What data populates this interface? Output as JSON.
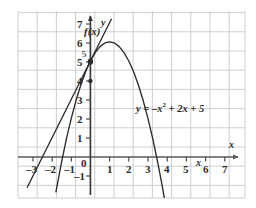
{
  "chart_data": {
    "type": "line",
    "title": "",
    "xlabel": "x",
    "ylabel": "y",
    "xlim": [
      -3.6,
      7.6
    ],
    "ylim": [
      -1.6,
      7.4
    ],
    "grid": true,
    "legend": "none",
    "series": [
      {
        "name": "parabola",
        "label": "y = –x² + 2x + 5",
        "equation": "y = -x^2 + 2x + 5",
        "color": "#2b2b2b",
        "x": [
          -1.8,
          -1.5,
          -1.25,
          -1.0,
          -0.75,
          -0.5,
          -0.25,
          0.0,
          0.25,
          0.5,
          0.75,
          1.0,
          1.25,
          1.5,
          1.75,
          2.0,
          2.25,
          2.5,
          2.75,
          3.0,
          3.25,
          3.5,
          3.75,
          4.0,
          4.1
        ],
        "y": [
          -1.84,
          -0.25,
          0.94,
          2.0,
          2.94,
          3.75,
          4.44,
          5.0,
          5.44,
          5.75,
          5.94,
          6.0,
          5.94,
          5.75,
          5.44,
          5.0,
          4.44,
          3.75,
          2.94,
          2.0,
          0.94,
          -0.25,
          -1.56,
          -3.0,
          -3.59
        ]
      },
      {
        "name": "tangent-line",
        "label": "f(x)",
        "equation": "y = 2x + 5",
        "color": "#2b2b2b",
        "x": [
          -3.3,
          1.1
        ],
        "y": [
          -1.6,
          7.2
        ]
      }
    ],
    "points": [
      {
        "name": "point-of-tangency",
        "x": 0,
        "y": 5,
        "label": "5"
      }
    ],
    "xticks": [
      -3,
      -2,
      -1,
      1,
      2,
      3,
      4,
      5,
      6,
      7
    ],
    "yticks": [
      -1,
      1,
      2,
      3,
      4,
      5,
      6,
      7
    ],
    "origin_label": "0"
  },
  "axes": {
    "x_axis_name": "x",
    "y_axis_name": "y"
  },
  "labels": {
    "function_label": "f(x)",
    "curve_equation_prefix": "y = –x",
    "curve_equation_exponent": "2",
    "curve_equation_suffix": " + 2x + 5",
    "stray_x_label": "x",
    "point_marker_label": "5"
  },
  "ticks": {
    "x_negative": [
      "–3",
      "–2",
      "–1"
    ],
    "x_positive": [
      "1",
      "2",
      "3",
      "4",
      "5",
      "6",
      "7"
    ],
    "y_positive": [
      "1",
      "2",
      "3",
      "4",
      "5",
      "6",
      "7"
    ],
    "y_negative": [
      "–1"
    ],
    "origin": "0"
  },
  "colors": {
    "grid": "#c9c9c9",
    "axis": "#5a5a5a",
    "curve": "#2b2b2b",
    "background": "#ffffff",
    "text": "#2b2b2b"
  }
}
